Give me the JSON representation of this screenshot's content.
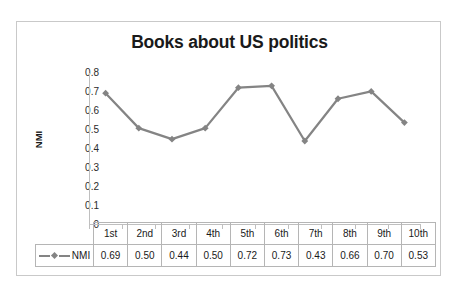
{
  "chart_data": {
    "type": "line",
    "title": "Books about US politics",
    "xlabel": "",
    "ylabel": "NMI",
    "categories": [
      "1st",
      "2nd",
      "3rd",
      "4th",
      "5th",
      "6th",
      "7th",
      "8th",
      "9th",
      "10th"
    ],
    "series": [
      {
        "name": "NMI",
        "values": [
          0.69,
          0.5,
          0.44,
          0.5,
          0.72,
          0.73,
          0.43,
          0.66,
          0.7,
          0.53
        ],
        "value_labels": [
          "0.69",
          "0.50",
          "0.44",
          "0.50",
          "0.72",
          "0.73",
          "0.43",
          "0.66",
          "0.70",
          "0.53"
        ],
        "color": "#848484",
        "marker": "diamond"
      }
    ],
    "ylim": [
      0,
      0.8
    ],
    "ytick_labels": [
      "0.8",
      "0.7",
      "0.6",
      "0.5",
      "0.4",
      "0.3",
      "0.2",
      "0.1",
      "0"
    ],
    "ytick_values": [
      0.8,
      0.7,
      0.6,
      0.5,
      0.4,
      0.3,
      0.2,
      0.1,
      0
    ],
    "grid": false,
    "legend": "data-table-row",
    "data_table_visible": true
  },
  "colors": {
    "series": "#848484",
    "axis": "#bfbfbf",
    "frame_border": "#c9c9c9",
    "table_border": "#b5b5b5",
    "text": "#1a1a1a",
    "background": "#ffffff"
  }
}
